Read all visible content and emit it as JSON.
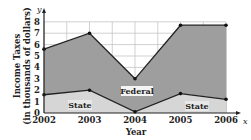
{
  "chart_data": {
    "type": "area",
    "title": "",
    "xlabel": "Year",
    "ylabel": "Income Taxes (in thousands of dollars)",
    "ylabel_line1": "Income Taxes",
    "ylabel_line2": "(in thousands of dollars)",
    "x_axis_letter": "x",
    "y_axis_letter": "y",
    "categories": [
      "2002",
      "2003",
      "2004",
      "2005",
      "2006"
    ],
    "y_ticks": [
      "0",
      "1",
      "2",
      "3",
      "4",
      "5",
      "6",
      "7",
      "8"
    ],
    "ylim": [
      0,
      8
    ],
    "grid": true,
    "stacked": true,
    "series": [
      {
        "name": "State",
        "values": [
          1.6,
          2.0,
          0.1,
          1.7,
          1.2
        ],
        "color": "#d4d4d4"
      },
      {
        "name": "Federal",
        "values": [
          4.0,
          5.0,
          2.9,
          6.0,
          6.5
        ],
        "color": "#9a9a9a"
      }
    ],
    "total_values": [
      5.6,
      7.0,
      3.0,
      7.7,
      7.7
    ],
    "region_labels": {
      "federal": "Federal",
      "state_left": "State",
      "state_right": "State"
    },
    "colors": {
      "federal_fill": "#9e9e9e",
      "state_fill": "#d6d6d6",
      "line": "#222222",
      "grid": "#bdbdbd"
    }
  }
}
